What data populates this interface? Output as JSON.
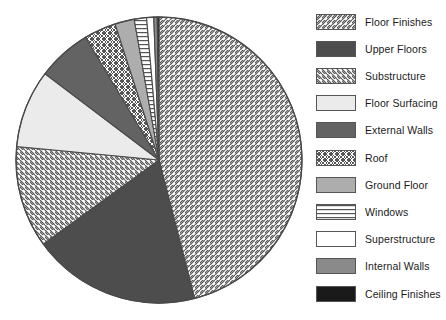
{
  "chart_data": {
    "type": "pie",
    "title": "",
    "legend_position": "right",
    "grid": false,
    "start_angle_deg": 0,
    "direction": "clockwise",
    "categories": [
      "Floor Finishes",
      "Upper Floors",
      "Substructure",
      "Floor Surfacing",
      "External Walls",
      "Roof",
      "Ground Floor",
      "Windows",
      "Superstructure",
      "Internal Walls",
      "Ceiling Finishes"
    ],
    "values": [
      46.0,
      19.0,
      11.5,
      8.8,
      6.1,
      3.6,
      2.2,
      1.4,
      0.8,
      0.4,
      0.2
    ],
    "unit": "percent",
    "slice_angles_deg": [
      165.6,
      68.4,
      41.4,
      31.7,
      22.0,
      13.0,
      7.9,
      5.0,
      2.9,
      1.4,
      0.7
    ],
    "colors": [
      "#ffffff",
      "#4d4d4d",
      "#ffffff",
      "#ebebeb",
      "#636363",
      "#ffffff",
      "#adadad",
      "#ffffff",
      "#ffffff",
      "#8a8a8a",
      "#1a1a1a"
    ],
    "patterns": [
      "diagonal-hatch-forward",
      "solid",
      "diagonal-hatch-back",
      "solid",
      "solid",
      "cross-hatch",
      "solid",
      "horizontal-lines",
      "solid",
      "solid",
      "solid"
    ]
  },
  "legend": {
    "items": [
      {
        "label": "Floor Finishes",
        "pattern": "diagonal-hatch-forward",
        "color": "#ffffff"
      },
      {
        "label": "Upper Floors",
        "pattern": "solid",
        "color": "#4d4d4d"
      },
      {
        "label": "Substructure",
        "pattern": "diagonal-hatch-back",
        "color": "#ffffff"
      },
      {
        "label": "Floor Surfacing",
        "pattern": "solid",
        "color": "#ebebeb"
      },
      {
        "label": "External Walls",
        "pattern": "solid",
        "color": "#636363"
      },
      {
        "label": "Roof",
        "pattern": "cross-hatch",
        "color": "#ffffff"
      },
      {
        "label": "Ground Floor",
        "pattern": "solid",
        "color": "#adadad"
      },
      {
        "label": "Windows",
        "pattern": "horizontal-lines",
        "color": "#ffffff"
      },
      {
        "label": "Superstructure",
        "pattern": "solid",
        "color": "#ffffff"
      },
      {
        "label": "Internal Walls",
        "pattern": "solid",
        "color": "#8a8a8a"
      },
      {
        "label": "Ceiling Finishes",
        "pattern": "solid",
        "color": "#1a1a1a"
      }
    ]
  },
  "geometry": {
    "center_x": 159,
    "center_y": 160,
    "radius": 143,
    "outline_color": "#4a4a4a"
  }
}
